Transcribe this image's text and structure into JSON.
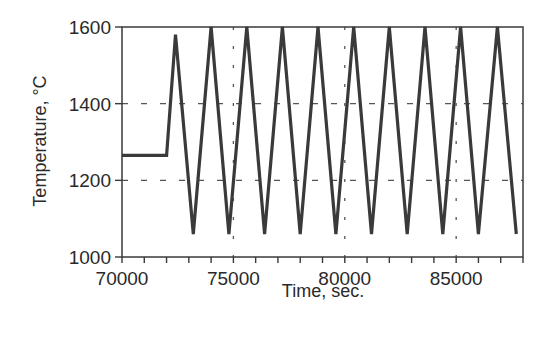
{
  "chart_data": {
    "type": "line",
    "title": "",
    "xlabel": "Time, sec.",
    "ylabel": "Temperature, °C",
    "xlim": [
      70000,
      88000
    ],
    "ylim": [
      1000,
      1600
    ],
    "x_ticks": [
      70000,
      75000,
      80000,
      85000
    ],
    "x_tick_labels": [
      "70000",
      "75000",
      "80000",
      "85000"
    ],
    "x_minor_tick_step": 1000,
    "y_ticks": [
      1000,
      1200,
      1400,
      1600
    ],
    "y_tick_labels": [
      "1000",
      "1200",
      "1400",
      "1600"
    ],
    "grid": {
      "horizontal_dashed": [
        1200,
        1400
      ],
      "vertical_dashed": [
        75000,
        80000,
        85000
      ]
    },
    "legend": null,
    "series": [
      {
        "name": "Temperature profile",
        "color": "#3a3a3a",
        "x": [
          70000,
          72000,
          72400,
          73200,
          74000,
          74800,
          75600,
          76400,
          77200,
          78000,
          78800,
          79600,
          80400,
          81200,
          82000,
          82800,
          83600,
          84400,
          85200,
          86000,
          86850,
          87700
        ],
        "y": [
          1265,
          1265,
          1580,
          1060,
          1600,
          1060,
          1600,
          1060,
          1600,
          1060,
          1600,
          1060,
          1600,
          1060,
          1600,
          1060,
          1600,
          1060,
          1600,
          1060,
          1600,
          1060
        ]
      }
    ]
  },
  "colors": {
    "line": "#3a3a3a",
    "axis": "#3a3a3a",
    "grid": "#555555",
    "background": "#ffffff"
  }
}
